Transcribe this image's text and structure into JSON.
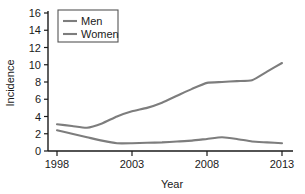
{
  "chart_data": {
    "type": "line",
    "title": "",
    "xlabel": "Year",
    "ylabel": "Incidence",
    "xlim": [
      1998,
      2013
    ],
    "ylim": [
      0,
      16
    ],
    "grid": false,
    "legend_position": "top-left",
    "xticks": [
      "1998",
      "2003",
      "2008",
      "2013"
    ],
    "xtick_values": [
      1998,
      2003,
      2008,
      2013
    ],
    "yticks": [
      "0",
      "2",
      "4",
      "6",
      "8",
      "10",
      "12",
      "14",
      "16"
    ],
    "ytick_values": [
      0,
      2,
      4,
      6,
      8,
      10,
      12,
      14,
      16
    ],
    "x": [
      1998,
      1999,
      2000,
      2001,
      2002,
      2003,
      2004,
      2005,
      2006,
      2007,
      2008,
      2009,
      2010,
      2011,
      2012,
      2013
    ],
    "series": [
      {
        "name": "Men",
        "color": "#7d7d7d",
        "values": [
          3.1,
          2.9,
          2.7,
          3.2,
          4.0,
          4.6,
          5.0,
          5.6,
          6.4,
          7.2,
          7.9,
          8.0,
          8.1,
          8.2,
          9.2,
          10.2
        ]
      },
      {
        "name": "Women",
        "color": "#7d7d7d",
        "values": [
          2.4,
          2.0,
          1.6,
          1.2,
          0.9,
          0.9,
          0.95,
          1.0,
          1.1,
          1.2,
          1.4,
          1.6,
          1.4,
          1.1,
          1.0,
          0.9
        ]
      }
    ]
  },
  "legend": {
    "entries": [
      {
        "label": "Men"
      },
      {
        "label": "Women"
      }
    ]
  },
  "axes": {
    "y_title": "Incidence",
    "x_title": "Year"
  },
  "colors": {
    "men_line": "#7d7d7d",
    "women_line": "#7d7d7d",
    "axis": "#1a1a1a",
    "legend_border": "#555555",
    "background": "#ffffff"
  }
}
